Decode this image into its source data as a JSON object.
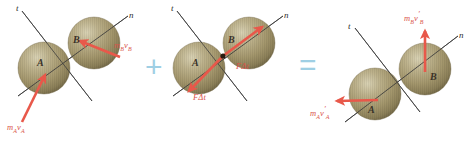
{
  "figure": {
    "type": "physics-impact-diagram",
    "background_color": "#ffffff",
    "sphere_color": "#a89a72",
    "arrow_color": "#e8584a",
    "axis_color": "#3a3a3a",
    "operator_color": "#9fcfe4"
  },
  "operators": {
    "plus": "+",
    "equals": "="
  },
  "panels": [
    {
      "id": "initial-momenta",
      "name": "initial-momenta-panel",
      "axes": {
        "tangent": "t",
        "normal": "n"
      },
      "spheres": [
        {
          "id": "A",
          "label": "A"
        },
        {
          "id": "B",
          "label": "B"
        }
      ],
      "vectors": [
        {
          "id": "mA-vA",
          "m": "m",
          "m_sub": "A",
          "v": "v",
          "v_sub": "A",
          "prime": "",
          "direction": "up-right"
        },
        {
          "id": "mB-vB",
          "m": "m",
          "m_sub": "B",
          "v": "v",
          "v_sub": "B",
          "prime": "",
          "direction": "up-left"
        }
      ]
    },
    {
      "id": "impulse",
      "name": "impulse-panel",
      "axes": {
        "tangent": "t",
        "normal": "n"
      },
      "spheres": [
        {
          "id": "A",
          "label": "A"
        },
        {
          "id": "B",
          "label": "B"
        }
      ],
      "contact_point": true,
      "vectors": [
        {
          "id": "impulse-on-A",
          "f": "F",
          "delta": "Δ",
          "t": "t",
          "direction": "down-left"
        },
        {
          "id": "impulse-on-B",
          "f": "F",
          "delta": "Δ",
          "t": "t",
          "direction": "up-right"
        }
      ]
    },
    {
      "id": "final-momenta",
      "name": "final-momenta-panel",
      "axes": {
        "tangent": "t",
        "normal": "n"
      },
      "spheres": [
        {
          "id": "A",
          "label": "A"
        },
        {
          "id": "B",
          "label": "B"
        }
      ],
      "vectors": [
        {
          "id": "mA-vA-prime",
          "m": "m",
          "m_sub": "A",
          "v": "v",
          "v_sub": "A",
          "prime": "′",
          "direction": "left"
        },
        {
          "id": "mB-vB-prime",
          "m": "m",
          "m_sub": "B",
          "v": "v",
          "v_sub": "B",
          "prime": "′",
          "direction": "up"
        }
      ]
    }
  ],
  "labels": {
    "t_axis": "t",
    "n_axis": "n",
    "sphere_a": "A",
    "sphere_b": "B",
    "m": "m",
    "v": "v",
    "sub_a": "A",
    "sub_b": "B",
    "prime": "′",
    "force": "F",
    "delta_t": "Δt"
  }
}
